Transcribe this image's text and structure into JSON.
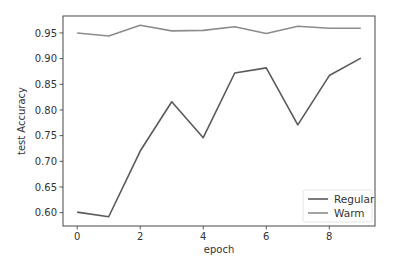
{
  "chart_data": {
    "type": "line",
    "title": "",
    "xlabel": "epoch",
    "ylabel": "test Accuracy",
    "x": [
      0,
      1,
      2,
      3,
      4,
      5,
      6,
      7,
      8,
      9
    ],
    "series": [
      {
        "name": "Regular",
        "color": "#5a5a5a",
        "values": [
          0.601,
          0.592,
          0.72,
          0.816,
          0.746,
          0.872,
          0.882,
          0.771,
          0.867,
          0.901
        ]
      },
      {
        "name": "Warm",
        "color": "#8c8c8c",
        "values": [
          0.95,
          0.944,
          0.965,
          0.954,
          0.955,
          0.962,
          0.949,
          0.963,
          0.959,
          0.959
        ]
      }
    ],
    "xticks": [
      0,
      2,
      4,
      6,
      8
    ],
    "yticks": [
      0.6,
      0.65,
      0.7,
      0.75,
      0.8,
      0.85,
      0.9,
      0.95
    ],
    "ytick_labels": [
      "0.60",
      "0.65",
      "0.70",
      "0.75",
      "0.80",
      "0.85",
      "0.90",
      "0.95"
    ],
    "xlim": [
      -0.45,
      9.45
    ],
    "ylim": [
      0.574,
      0.983
    ],
    "grid": false,
    "legend_position": "lower right"
  }
}
